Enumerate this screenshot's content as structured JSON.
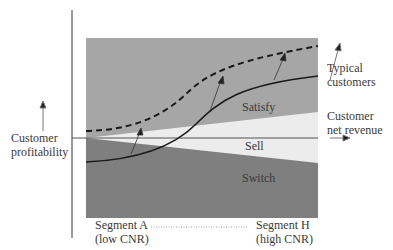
{
  "diagram": {
    "y_axis_label_line1": "Customer",
    "y_axis_label_line2": "profitability",
    "x_axis_label_line1": "Customer",
    "x_axis_label_line2": "net revenue",
    "curve_label_line1": "Typical",
    "curve_label_line2": "customers",
    "regions": {
      "satisfy": "Satisfy",
      "sell": "Sell",
      "switch": "Switch"
    },
    "segment_left_line1": "Segment A",
    "segment_left_line2": "(low CNR)",
    "segment_right_line1": "Segment H",
    "segment_right_line2": "(high CNR)",
    "colors": {
      "upper_region": "#a6a6a6",
      "wedge_region": "#ececec",
      "lower_region": "#7f7f7f",
      "lines": "#1a1a1a"
    }
  }
}
